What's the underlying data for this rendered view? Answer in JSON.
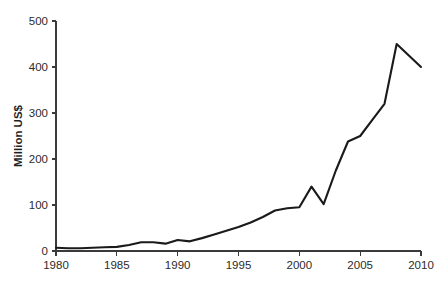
{
  "chart_data": {
    "type": "line",
    "title": "",
    "subtitle": "",
    "xlabel": "",
    "ylabel": "Million US$",
    "xlim": [
      1980,
      2010
    ],
    "ylim": [
      0,
      500
    ],
    "grid": false,
    "legend": false,
    "legend_position": "none",
    "line_color": "#1a1a1a",
    "background_color": "#ffffff",
    "axis_color": "#3a3a3a",
    "x_ticks": [
      1980,
      1985,
      1990,
      1995,
      2000,
      2005,
      2010
    ],
    "x_tick_labels": [
      "1980",
      "1985",
      "1990",
      "1995",
      "2000",
      "2005",
      "2010"
    ],
    "y_ticks": [
      0,
      100,
      200,
      300,
      400,
      500
    ],
    "y_tick_labels": [
      "0",
      "100",
      "200",
      "300",
      "400",
      "500"
    ],
    "x": [
      1980,
      1981,
      1982,
      1983,
      1984,
      1985,
      1986,
      1987,
      1988,
      1989,
      1990,
      1991,
      1992,
      1993,
      1994,
      1995,
      1996,
      1997,
      1998,
      1999,
      2000,
      2001,
      2002,
      2003,
      2004,
      2005,
      2006,
      2007,
      2008,
      2009,
      2010
    ],
    "values": [
      7,
      6,
      6,
      7,
      8,
      9,
      13,
      19,
      19,
      16,
      24,
      21,
      28,
      36,
      44,
      52,
      62,
      74,
      88,
      93,
      95,
      140,
      102,
      175,
      238,
      250,
      285,
      320,
      450,
      425,
      400
    ],
    "series": [
      {
        "name": "Value",
        "values": [
          7,
          6,
          6,
          7,
          8,
          9,
          13,
          19,
          19,
          16,
          24,
          21,
          28,
          36,
          44,
          52,
          62,
          74,
          88,
          93,
          95,
          140,
          102,
          175,
          238,
          250,
          285,
          320,
          450,
          425,
          400
        ]
      }
    ],
    "annotations": []
  },
  "plot_geometry": {
    "left": 56,
    "right": 421,
    "top": 21,
    "bottom": 251
  }
}
